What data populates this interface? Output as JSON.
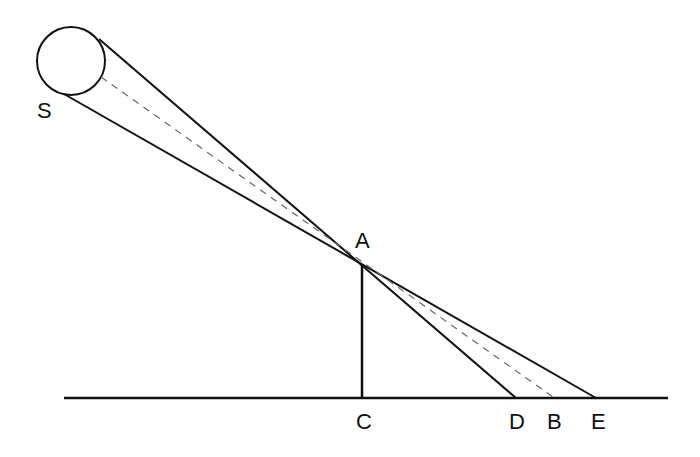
{
  "diagram": {
    "colors": {
      "stroke": "#111111",
      "dashed": "#666666",
      "background": "#ffffff"
    },
    "labels": {
      "sun": "S",
      "pole_top": "A",
      "pole_base": "C",
      "umbra_end": "D",
      "center_end": "B",
      "penumbra_end": "E"
    },
    "elements": [
      {
        "id": "sun",
        "type": "circle",
        "label": "S"
      },
      {
        "id": "ray-upper",
        "type": "line",
        "from": "sun",
        "through": "A",
        "to": "D"
      },
      {
        "id": "ray-lower",
        "type": "line",
        "from": "sun",
        "through": "A",
        "to": "E"
      },
      {
        "id": "ray-center",
        "type": "dashed-line",
        "from": "sun",
        "through": "A",
        "to": "B"
      },
      {
        "id": "pole",
        "type": "line",
        "from": "A",
        "to": "C"
      },
      {
        "id": "ground",
        "type": "line",
        "through": [
          "C",
          "D",
          "B",
          "E"
        ]
      }
    ]
  }
}
